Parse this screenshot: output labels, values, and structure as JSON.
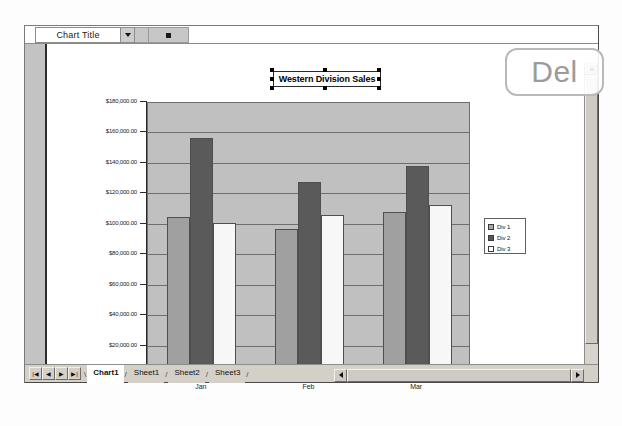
{
  "toolbar": {
    "name_box_value": "Chart Title",
    "dropdown_icon": "chevron-down-icon",
    "format_button_icon": "square-icon",
    "formula_value": ""
  },
  "chart": {
    "title": "Western Division Sales"
  },
  "legend": {
    "items": [
      {
        "label": "Div 1",
        "color": "#a8a8a8"
      },
      {
        "label": "Div 2",
        "color": "#585858"
      },
      {
        "label": "Div 3",
        "color": "#ffffff"
      }
    ]
  },
  "sheet_tabs": {
    "first_icon": "first-sheet-icon",
    "prev_icon": "prev-sheet-icon",
    "next_icon": "next-sheet-icon",
    "last_icon": "last-sheet-icon",
    "tabs": [
      {
        "label": "Chart1",
        "active": true
      },
      {
        "label": "Sheet1",
        "active": false
      },
      {
        "label": "Sheet2",
        "active": false
      },
      {
        "label": "Sheet3",
        "active": false
      }
    ]
  },
  "overlay": {
    "key_label": "Del"
  },
  "scrollbars": {
    "up_icon": "scroll-up-icon",
    "down_icon": "scroll-down-icon",
    "left_icon": "scroll-left-icon",
    "right_icon": "scroll-right-icon"
  },
  "chart_data": {
    "type": "bar",
    "title": "Western Division Sales",
    "categories": [
      "Jan",
      "Feb",
      "Mar"
    ],
    "series": [
      {
        "name": "Div 1",
        "values": [
          104000,
          96000,
          107000
        ],
        "color": "#a0a0a0"
      },
      {
        "name": "Div 2",
        "values": [
          156000,
          127000,
          137000
        ],
        "color": "#5a5a5a"
      },
      {
        "name": "Div 3",
        "values": [
          100000,
          105000,
          112000
        ],
        "color": "#f7f7f7"
      }
    ],
    "xlabel": "",
    "ylabel": "",
    "ylim": [
      0,
      180000
    ],
    "ytick_values": [
      0,
      20000,
      40000,
      60000,
      80000,
      100000,
      120000,
      140000,
      160000,
      180000
    ],
    "ytick_labels": [
      "$-",
      "$20,000.00",
      "$40,000.00",
      "$60,000.00",
      "$80,000.00",
      "$100,000.00",
      "$120,000.00",
      "$140,000.00",
      "$160,000.00",
      "$180,000.00"
    ],
    "grid": true,
    "legend_position": "right",
    "plot_background": "#c0c0c0"
  }
}
